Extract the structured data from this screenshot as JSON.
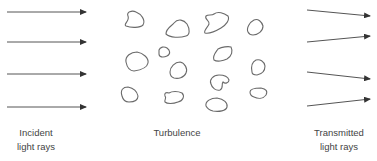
{
  "diagram": {
    "colors": {
      "ray": "#555555",
      "eddy": "#6a6a6a",
      "text": "#444444",
      "background": "#ffffff"
    },
    "incident": {
      "label_lines": [
        "Incident",
        "light rays"
      ],
      "ray_count": 4,
      "icon": "arrow-right-icon"
    },
    "turbulence": {
      "label": "Turbulence",
      "eddy_count": 14,
      "icon": "eddy-blob-icon"
    },
    "transmitted": {
      "label_lines": [
        "Transmitted",
        "light rays"
      ],
      "ray_count": 4,
      "deflections": [
        "down",
        "up",
        "down",
        "up"
      ],
      "icon": "arrow-right-icon"
    }
  }
}
